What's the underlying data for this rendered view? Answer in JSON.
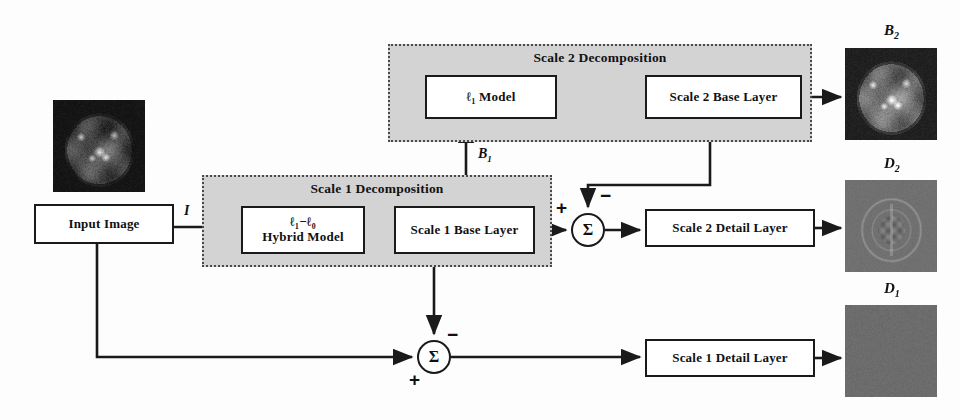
{
  "diagram": {
    "groups": [
      {
        "id": "scale2",
        "label": "Scale 2 Decomposition",
        "x": 388,
        "y": 44,
        "w": 424,
        "h": 98
      },
      {
        "id": "scale1",
        "label": "Scale 1 Decomposition",
        "x": 202,
        "y": 175,
        "w": 350,
        "h": 92
      }
    ],
    "boxes": [
      {
        "id": "input-image",
        "label": "Input Image",
        "x": 34,
        "y": 204,
        "w": 140,
        "h": 40
      },
      {
        "id": "hybrid-model",
        "label_line1": "ℓ₁−ℓ₀",
        "label_line2": "Hybrid Model",
        "x": 241,
        "y": 206,
        "w": 124,
        "h": 48
      },
      {
        "id": "scale1-base-layer",
        "label": "Scale 1 Base Layer",
        "x": 394,
        "y": 206,
        "w": 141,
        "h": 48
      },
      {
        "id": "l1-model",
        "label": "ℓ₁ Model",
        "x": 425,
        "y": 75,
        "w": 132,
        "h": 44
      },
      {
        "id": "scale2-base-layer",
        "label": "Scale 2 Base Layer",
        "x": 645,
        "y": 75,
        "w": 157,
        "h": 44
      },
      {
        "id": "scale2-detail-layer",
        "label": "Scale 2 Detail  Layer",
        "x": 645,
        "y": 209,
        "w": 170,
        "h": 38
      },
      {
        "id": "scale1-detail-layer",
        "label": "Scale 1 Detail  Layer",
        "x": 645,
        "y": 339,
        "w": 170,
        "h": 38
      }
    ],
    "sum_nodes": [
      {
        "id": "sum-scale2",
        "cx": 588,
        "cy": 230,
        "symbol": "Σ",
        "signs": [
          {
            "text": "+",
            "pos": "left-top"
          },
          {
            "text": "−",
            "pos": "top-right"
          }
        ]
      },
      {
        "id": "sum-scale1",
        "cx": 434,
        "cy": 357,
        "symbol": "Σ",
        "signs": [
          {
            "text": "+",
            "pos": "bottom-left"
          },
          {
            "text": "−",
            "pos": "top-right"
          }
        ]
      }
    ],
    "edge_labels": [
      {
        "id": "label-I",
        "text": "I",
        "sub": "",
        "x": 184,
        "y": 205
      },
      {
        "id": "label-B1",
        "text": "B",
        "sub": "1",
        "x": 482,
        "y": 148
      }
    ],
    "thumbnails": [
      {
        "id": "input-thumb",
        "label": "",
        "x": 53,
        "y": 100,
        "w": 92,
        "h": 92,
        "kind": "mri-dark"
      },
      {
        "id": "thumb-B2",
        "label": "B",
        "sub": "2",
        "x": 845,
        "y": 48,
        "w": 92,
        "h": 92,
        "kind": "mri-base"
      },
      {
        "id": "thumb-D2",
        "label": "D",
        "sub": "2",
        "x": 845,
        "y": 180,
        "w": 92,
        "h": 92,
        "kind": "detail-edges"
      },
      {
        "id": "thumb-D1",
        "label": "D",
        "sub": "1",
        "x": 845,
        "y": 305,
        "w": 92,
        "h": 92,
        "kind": "detail-flat"
      }
    ],
    "colors": {
      "group_fill": "#d3d3d3",
      "group_border": "#4a4a4a",
      "box_border": "#1a1a1a",
      "box_fill": "#ffffff",
      "line": "#1a1a1a",
      "page_bg": "#fdfdfd"
    },
    "connections": [
      {
        "id": "conn-input-to-hybrid",
        "from": "input-image",
        "to": "hybrid-model",
        "label": "I"
      },
      {
        "id": "conn-hybrid-to-scale1base",
        "from": "hybrid-model",
        "to": "scale1-base-layer"
      },
      {
        "id": "conn-scale1base-up-to-l1model",
        "from": "scale1-base-layer",
        "to": "l1-model",
        "label": "B1"
      },
      {
        "id": "conn-l1model-to-scale2base",
        "from": "l1-model",
        "to": "scale2-base-layer"
      },
      {
        "id": "conn-scale2base-to-B2",
        "from": "scale2-base-layer",
        "to": "thumb-B2"
      },
      {
        "id": "conn-scale1base-to-sum2",
        "from": "scale1-base-layer",
        "to": "sum-scale2",
        "sign": "+"
      },
      {
        "id": "conn-scale2base-down-to-sum2",
        "from": "scale2-base-layer",
        "to": "sum-scale2",
        "sign": "-"
      },
      {
        "id": "conn-sum2-to-scale2detail",
        "from": "sum-scale2",
        "to": "scale2-detail-layer"
      },
      {
        "id": "conn-scale2detail-to-D2",
        "from": "scale2-detail-layer",
        "to": "thumb-D2"
      },
      {
        "id": "conn-scale1base-down-to-sum1",
        "from": "scale1-base-layer",
        "to": "sum-scale1",
        "sign": "-"
      },
      {
        "id": "conn-input-bottom-to-sum1",
        "from": "input-image",
        "to": "sum-scale1",
        "sign": "+"
      },
      {
        "id": "conn-sum1-to-scale1detail",
        "from": "sum-scale1",
        "to": "scale1-detail-layer"
      },
      {
        "id": "conn-scale1detail-to-D1",
        "from": "scale1-detail-layer",
        "to": "thumb-D1"
      }
    ]
  }
}
